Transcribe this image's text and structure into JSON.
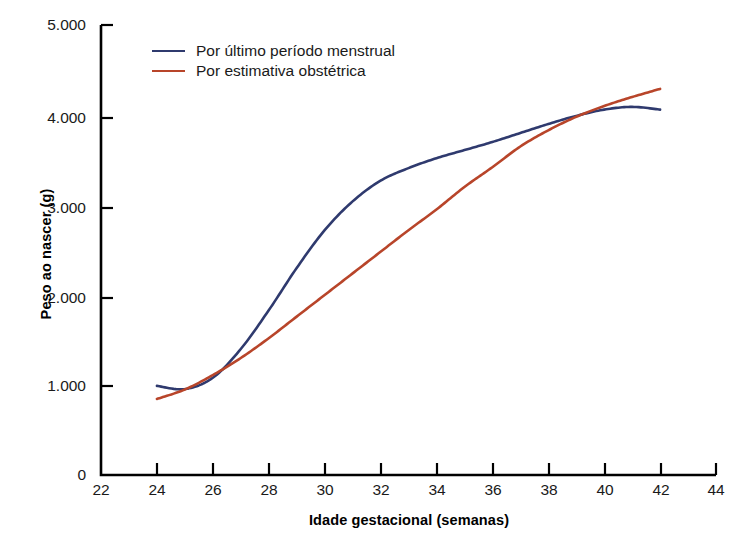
{
  "chart_data": {
    "type": "line",
    "title": "",
    "xlabel": "Idade gestacional (semanas)",
    "ylabel": "Peso ao nascer (g)",
    "xlim": [
      22,
      44
    ],
    "ylim": [
      0,
      5000
    ],
    "xticks": [
      "22",
      "24",
      "26",
      "28",
      "30",
      "32",
      "34",
      "36",
      "38",
      "40",
      "42",
      "44"
    ],
    "yticks": [
      "0",
      "1.000",
      "2.000",
      "3.000",
      "4.000",
      "5.000"
    ],
    "grid": false,
    "legend_position": "top-left-inside",
    "series": [
      {
        "name": "Por último período menstrual",
        "color": "#2f3a6e",
        "x": [
          24,
          25,
          26,
          27,
          28,
          29,
          30,
          31,
          32,
          33,
          34,
          35,
          36,
          37,
          38,
          39,
          40,
          41,
          42
        ],
        "values": [
          990,
          955,
          1080,
          1400,
          1830,
          2300,
          2720,
          3040,
          3270,
          3410,
          3520,
          3610,
          3700,
          3800,
          3900,
          3990,
          4060,
          4090,
          4060
        ]
      },
      {
        "name": "Por estimativa obstétrica",
        "color": "#b8452a",
        "x": [
          24,
          25,
          26,
          27,
          28,
          29,
          30,
          31,
          32,
          33,
          34,
          35,
          36,
          37,
          38,
          39,
          40,
          41,
          42
        ],
        "values": [
          845,
          950,
          1110,
          1300,
          1520,
          1760,
          2000,
          2240,
          2480,
          2720,
          2950,
          3200,
          3420,
          3650,
          3830,
          3980,
          4100,
          4200,
          4290
        ]
      }
    ]
  },
  "legend": {
    "items": [
      {
        "label": "Por último período menstrual",
        "color": "#2f3a6e"
      },
      {
        "label": "Por estimativa obstétrica",
        "color": "#b8452a"
      }
    ]
  },
  "axes": {
    "y_title": "Peso ao nascer (g)",
    "x_title": "Idade gestacional (semanas)",
    "y_tick_labels": [
      "5.000",
      "4.000",
      "3.000",
      "2.000",
      "1.000",
      "0"
    ],
    "x_tick_labels": [
      "22",
      "24",
      "26",
      "28",
      "30",
      "32",
      "34",
      "36",
      "38",
      "40",
      "42",
      "44"
    ],
    "axis_color": "#000000"
  }
}
